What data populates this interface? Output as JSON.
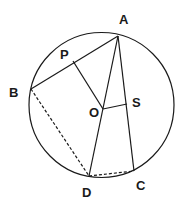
{
  "diagram": {
    "type": "circle-geometry",
    "circle": {
      "cx": 101.5,
      "cy": 105,
      "r": 72.5
    },
    "points": {
      "A": {
        "x": 118,
        "y": 36,
        "label": "A",
        "lx": 119,
        "ly": 24
      },
      "B": {
        "x": 31,
        "y": 89,
        "label": "B",
        "lx": 9,
        "ly": 97
      },
      "P": {
        "x": 73,
        "y": 61,
        "label": "P",
        "lx": 60,
        "ly": 59
      },
      "O": {
        "x": 103,
        "y": 109,
        "label": "O",
        "lx": 89,
        "ly": 117
      },
      "S": {
        "x": 127,
        "y": 104,
        "label": "S",
        "lx": 132,
        "ly": 107
      },
      "D": {
        "x": 89,
        "y": 176,
        "label": "D",
        "lx": 82,
        "ly": 197
      },
      "C": {
        "x": 134,
        "y": 171,
        "label": "C",
        "lx": 136,
        "ly": 190
      }
    },
    "segments": [
      {
        "from": "A",
        "to": "B",
        "style": "solid"
      },
      {
        "from": "P",
        "to": "O",
        "style": "solid"
      },
      {
        "from": "A",
        "to": "D",
        "style": "solid"
      },
      {
        "from": "A",
        "to": "C",
        "style": "solid"
      },
      {
        "from": "O",
        "to": "S",
        "style": "solid"
      },
      {
        "from": "B",
        "to": "D",
        "style": "dashed"
      },
      {
        "from": "D",
        "to": "C",
        "style": "dashed"
      }
    ],
    "stroke_color": "#1a1a1a"
  }
}
